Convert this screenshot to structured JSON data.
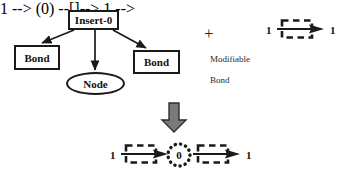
{
  "diagram": {
    "title_node": {
      "label": "Insert-0"
    },
    "children": [
      {
        "label": "Bond",
        "shape": "rectangle"
      },
      {
        "label": "Node",
        "shape": "ellipse"
      },
      {
        "label": "Bond",
        "shape": "rectangle"
      }
    ],
    "operator": {
      "plus": "+"
    },
    "annotation": {
      "line1": "Modifiable",
      "line2": "Bond"
    },
    "input_pattern": {
      "left_label": "1",
      "right_label": "1",
      "glyph": "modifiable-bond-arrow"
    },
    "transform_arrow": {
      "icon": "down-block-arrow",
      "color": "#7a7a7a"
    },
    "output_pattern": {
      "left_label": "1",
      "right_label": "1",
      "center_label": "0",
      "glyph_left": "modifiable-bond-arrow",
      "glyph_right": "modifiable-bond-arrow",
      "center_shape": "dotted-circle"
    },
    "colors": {
      "stroke": "#1a1a1a",
      "text": "#111111",
      "muted_text": "#2b2b2b",
      "arrow_fill": "#7a7a7a",
      "background": "#ffffff"
    }
  }
}
